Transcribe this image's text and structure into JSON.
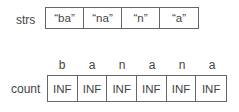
{
  "strs": {
    "label": "strs",
    "items": [
      "“ba”",
      "“na”",
      "“n”",
      "“a”"
    ]
  },
  "count": {
    "label": "count",
    "letters": [
      "b",
      "a",
      "n",
      "a",
      "n",
      "a"
    ],
    "values": [
      "INF",
      "INF",
      "INF",
      "INF",
      "INF",
      "INF"
    ]
  }
}
